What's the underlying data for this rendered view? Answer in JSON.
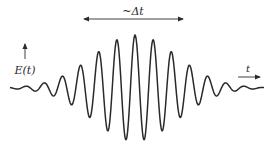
{
  "diagram": {
    "title_label": "~Δt",
    "y_axis_label": "E(t)",
    "x_axis_label": "t",
    "waveform": {
      "type": "gaussian-modulated-cosine",
      "center_x": 135,
      "baseline_y": 88,
      "period_px": 18.2,
      "peak_amplitude_px": 53,
      "envelope_sigma_px": 42,
      "x_start": 10,
      "x_end": 264,
      "stroke": "#2a2a2a"
    },
    "duration_arrow": {
      "x1": 84,
      "x2": 183,
      "y": 19
    }
  }
}
